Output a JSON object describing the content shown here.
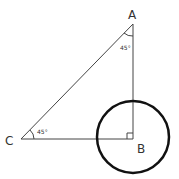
{
  "diagram": {
    "vertices": {
      "A": {
        "label": "A",
        "x": 133,
        "y": 24
      },
      "B": {
        "label": "B",
        "x": 133,
        "y": 139
      },
      "C": {
        "label": "C",
        "x": 21,
        "y": 139
      }
    },
    "angles": {
      "A": {
        "text": "45°"
      },
      "C": {
        "text": "45°"
      },
      "B": {
        "right_angle": true
      }
    },
    "circle": {
      "cx": 133,
      "cy": 137,
      "r": 37,
      "stroke": "#111111"
    },
    "line_color": "#444444"
  }
}
